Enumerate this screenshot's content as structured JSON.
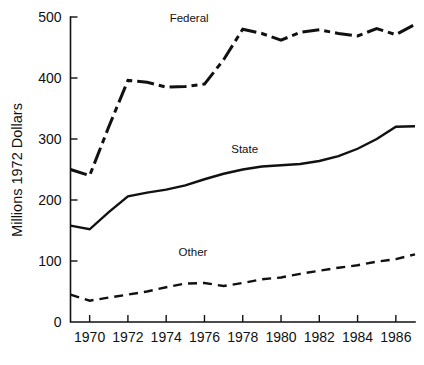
{
  "chart_data": {
    "type": "line",
    "title": "",
    "subtitle": "",
    "xlabel": "",
    "ylabel": "Millions 1972 Dollars",
    "xlim": [
      1969,
      1987
    ],
    "ylim": [
      0,
      500
    ],
    "grid": false,
    "legend_position": "inline-annotations",
    "x": [
      1969,
      1970,
      1971,
      1972,
      1973,
      1974,
      1975,
      1976,
      1977,
      1978,
      1979,
      1980,
      1981,
      1982,
      1983,
      1984,
      1985,
      1986,
      1987
    ],
    "xticks": [
      1970,
      1972,
      1974,
      1976,
      1978,
      1980,
      1982,
      1984,
      1986
    ],
    "xticklabels": [
      "1970",
      "1972",
      "1974",
      "1976",
      "1978",
      "1980",
      "1982",
      "1984",
      "1986"
    ],
    "yticks": [
      0,
      100,
      200,
      300,
      400,
      500
    ],
    "yticklabels": [
      "0",
      "100",
      "200",
      "300",
      "400",
      "500"
    ],
    "series": [
      {
        "name": "Federal",
        "style": "dash-dot",
        "color": "#111111",
        "label_x": 1975.2,
        "label_y": 492,
        "values": [
          250,
          240,
          320,
          396,
          393,
          385,
          386,
          390,
          430,
          480,
          473,
          462,
          475,
          479,
          473,
          469,
          481,
          471,
          488
        ]
      },
      {
        "name": "State",
        "style": "solid",
        "color": "#111111",
        "label_x": 1978.1,
        "label_y": 277,
        "values": [
          158,
          152,
          180,
          206,
          212,
          217,
          224,
          234,
          243,
          250,
          255,
          257,
          259,
          264,
          272,
          284,
          300,
          320,
          321
        ]
      },
      {
        "name": "Other",
        "style": "dashed",
        "color": "#111111",
        "label_x": 1975.4,
        "label_y": 108,
        "values": [
          45,
          35,
          40,
          45,
          50,
          57,
          63,
          64,
          59,
          64,
          70,
          73,
          79,
          84,
          89,
          93,
          99,
          103,
          111
        ]
      }
    ]
  }
}
